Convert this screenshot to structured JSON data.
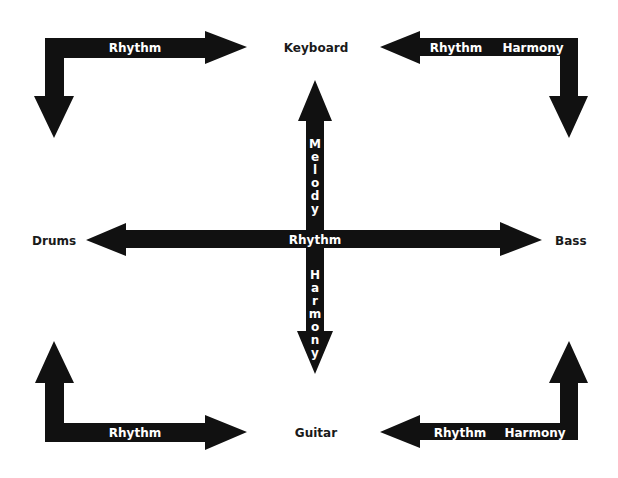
{
  "diagram": {
    "nodes": {
      "keyboard": "Keyboard",
      "drums": "Drums",
      "bass": "Bass",
      "guitar": "Guitar"
    },
    "arrows": {
      "top_left": {
        "labels": [
          "Rhythm"
        ],
        "from": "Keyboard",
        "to": "Drums"
      },
      "top_right": {
        "labels": [
          "Rhythm",
          "Harmony"
        ],
        "from": "Bass",
        "to": "Keyboard"
      },
      "bottom_left": {
        "labels": [
          "Rhythm"
        ],
        "from": "Drums",
        "to": "Guitar"
      },
      "bottom_right": {
        "labels": [
          "Rhythm",
          "Harmony"
        ],
        "from": "Bass",
        "to": "Guitar"
      },
      "center_horizontal": {
        "labels": [
          "Rhythm"
        ],
        "connects": [
          "Drums",
          "Bass"
        ]
      },
      "center_vertical_up": {
        "label": "Melody",
        "to": "Keyboard"
      },
      "center_vertical_down": {
        "label": "Harmony",
        "to": "Guitar"
      }
    },
    "colors": {
      "background": "#ffffff",
      "arrow": "#111111",
      "arrow_text": "#ffffff",
      "node_text": "#1a1a1a"
    }
  }
}
